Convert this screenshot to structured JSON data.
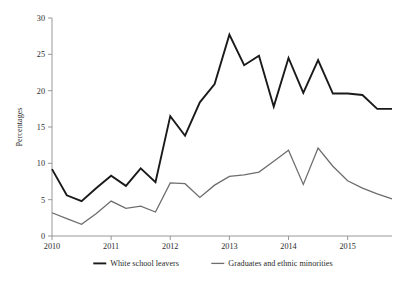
{
  "chart_data": {
    "type": "line",
    "title": "",
    "xlabel": "",
    "ylabel": "Percentages",
    "ylim": [
      0,
      30
    ],
    "yticks": [
      0,
      5,
      10,
      15,
      20,
      25,
      30
    ],
    "xticks": [
      "2010",
      "2011",
      "2012",
      "2013",
      "2014",
      "2015"
    ],
    "xtick_values": [
      2010,
      2011,
      2012,
      2013,
      2014,
      2015
    ],
    "xlim": [
      2010,
      2015.75
    ],
    "grid": false,
    "legend_position": "bottom",
    "x": [
      2010,
      2010.25,
      2010.5,
      2010.75,
      2011,
      2011.25,
      2011.5,
      2011.75,
      2012,
      2012.25,
      2012.5,
      2012.75,
      2013,
      2013.25,
      2013.5,
      2013.75,
      2014,
      2014.25,
      2014.5,
      2014.75,
      2015,
      2015.25,
      2015.5,
      2015.75
    ],
    "series": [
      {
        "name": "White school leavers",
        "color": "#1a1a1a",
        "values": [
          9.2,
          5.6,
          4.8,
          6.6,
          8.3,
          6.9,
          9.3,
          7.4,
          16.5,
          13.8,
          18.4,
          20.9,
          27.7,
          23.5,
          24.8,
          17.8,
          24.5,
          19.7,
          24.2,
          19.6,
          19.6,
          19.4,
          17.5,
          17.5
        ]
      },
      {
        "name": "Graduates and ethnic minorities",
        "color": "#6e6e6e",
        "values": [
          3.2,
          2.4,
          1.6,
          3.1,
          4.8,
          3.8,
          4.1,
          3.3,
          7.3,
          7.2,
          5.3,
          7.0,
          8.2,
          8.4,
          8.8,
          10.3,
          11.8,
          7.1,
          12.1,
          9.6,
          7.6,
          6.6,
          5.8,
          5.1
        ]
      }
    ],
    "legend": [
      {
        "label": "White school leavers",
        "color": "#1a1a1a"
      },
      {
        "label": "Graduates and ethnic minorities",
        "color": "#6e6e6e"
      }
    ]
  },
  "axes": {
    "y_axis_title": "Percentages",
    "y_tick_labels": [
      "0",
      "5",
      "10",
      "15",
      "20",
      "25",
      "30"
    ],
    "x_tick_labels": [
      "2010",
      "2011",
      "2012",
      "2013",
      "2014",
      "2015"
    ]
  },
  "colors": {
    "background": "#ffffff",
    "axis": "#8d8d8d",
    "text": "#2b2b2b",
    "series_black": "#1a1a1a",
    "series_gray": "#6e6e6e"
  }
}
